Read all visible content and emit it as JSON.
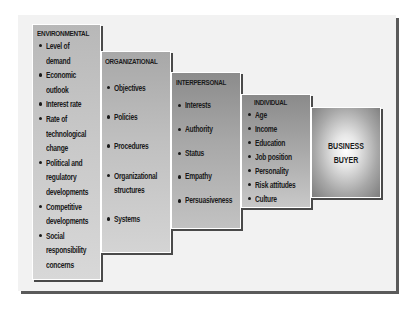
{
  "diagram": {
    "type": "staircase influence diagram",
    "stages": [
      {
        "id": "environmental",
        "title": "ENVIRONMENTAL",
        "items": [
          [
            "Level of",
            "demand"
          ],
          [
            "Economic",
            "outlook"
          ],
          [
            "Interest rate"
          ],
          [
            "Rate of",
            "technological",
            "change"
          ],
          [
            "Political and",
            "regulatory",
            "developments"
          ],
          [
            "Competitive",
            "developments"
          ],
          [
            "Social",
            "responsibility",
            "concerns"
          ]
        ]
      },
      {
        "id": "organizational",
        "title": "ORGANIZATIONAL",
        "items": [
          [
            "Objectives"
          ],
          [
            "Policies"
          ],
          [
            "Procedures"
          ],
          [
            "Organizational",
            "structures"
          ],
          [
            "Systems"
          ]
        ]
      },
      {
        "id": "interpersonal",
        "title": "INTERPERSONAL",
        "items": [
          [
            "Interests"
          ],
          [
            "Authority"
          ],
          [
            "Status"
          ],
          [
            "Empathy"
          ],
          [
            "Persuasiveness"
          ]
        ]
      },
      {
        "id": "individual",
        "title": "INDIVIDUAL",
        "items": [
          [
            "Age"
          ],
          [
            "Income"
          ],
          [
            "Education"
          ],
          [
            "Job position"
          ],
          [
            "Personality"
          ],
          [
            "Risk attitudes"
          ],
          [
            "Culture"
          ]
        ]
      }
    ],
    "target": {
      "title": "BUSINESS\nBUYER"
    }
  },
  "colors": {
    "frame_bg": "#f2f2f2",
    "frame_shadow": "#5a5a5a",
    "box_shadow": "#4a4a4a",
    "text": "#1a1a1a"
  }
}
